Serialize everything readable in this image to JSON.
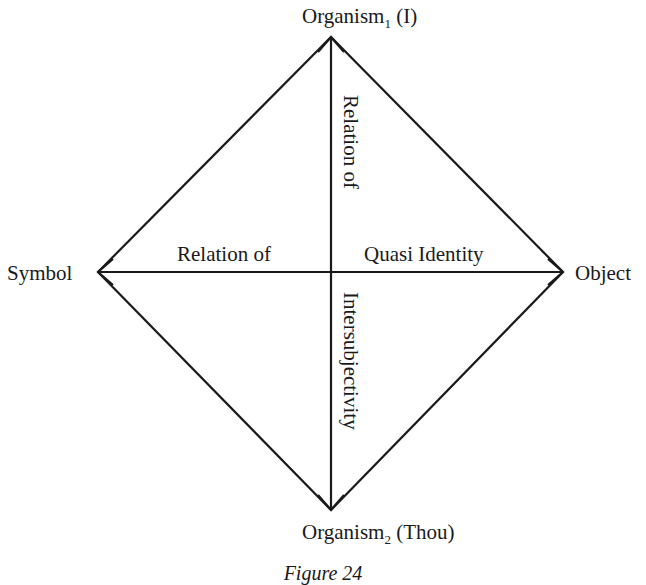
{
  "diagram": {
    "nodes": {
      "top": {
        "label": "Organism",
        "subscript": "1",
        "suffix": " (I)"
      },
      "bottom": {
        "label": "Organism",
        "subscript": "2",
        "suffix": " (Thou)"
      },
      "left": {
        "label": "Symbol"
      },
      "right": {
        "label": "Object"
      }
    },
    "axis_labels": {
      "horizontal_left": "Relation of",
      "horizontal_right": "Quasi Identity",
      "vertical_top": "Relation of",
      "vertical_bottom": "Intersubjectivity"
    },
    "caption": "Figure 24",
    "line_color": "#1a1a1a"
  }
}
